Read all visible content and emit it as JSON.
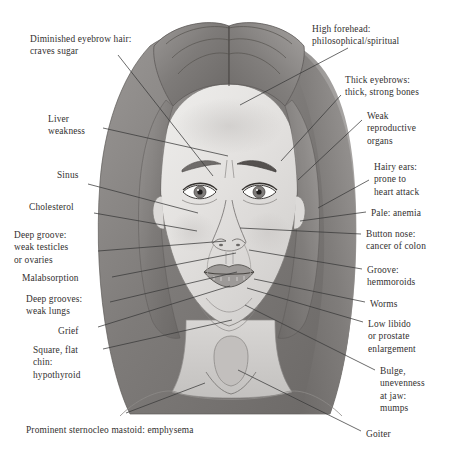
{
  "diagram": {
    "caption": "Prominent sternocleo mastoid: emphysema",
    "line_color": "#3a3a3a",
    "text_color": "#333030",
    "background": "#ffffff"
  },
  "labels_left": [
    {
      "id": "eyebrow-hair",
      "text": "Diminished eyebrow hair:\ncraves sugar",
      "x": 30,
      "y": 33
    },
    {
      "id": "liver",
      "text": "Liver\nweakness",
      "x": 48,
      "y": 113
    },
    {
      "id": "sinus",
      "text": "Sinus",
      "x": 57,
      "y": 169
    },
    {
      "id": "cholesterol",
      "text": "Cholesterol",
      "x": 29,
      "y": 201
    },
    {
      "id": "deep-groove",
      "text": "Deep groove:\nweak testicles\nor ovaries",
      "x": 14,
      "y": 229
    },
    {
      "id": "malabsorption",
      "text": "Malabsorption",
      "x": 22,
      "y": 272
    },
    {
      "id": "deep-grooves",
      "text": "Deep grooves:\nweak lungs",
      "x": 26,
      "y": 293
    },
    {
      "id": "grief",
      "text": "Grief",
      "x": 58,
      "y": 325
    },
    {
      "id": "square-chin",
      "text": "Square, flat\nchin:\nhypothyroid",
      "x": 33,
      "y": 344
    }
  ],
  "labels_right": [
    {
      "id": "high-forehead",
      "text": "High forehead:\nphilosophical/spiritual",
      "x": 312,
      "y": 23
    },
    {
      "id": "thick-eyebrows",
      "text": "Thick eyebrows:\nthick, strong bones",
      "x": 345,
      "y": 74
    },
    {
      "id": "weak-repro",
      "text": "Weak\nreproductive\norgans",
      "x": 367,
      "y": 110
    },
    {
      "id": "hairy-ears",
      "text": "Hairy ears:\nprone to\nheart attack",
      "x": 374,
      "y": 161
    },
    {
      "id": "pale-anemia",
      "text": "Pale: anemia",
      "x": 371,
      "y": 207
    },
    {
      "id": "button-nose",
      "text": "Button nose:\ncancer of colon",
      "x": 366,
      "y": 228
    },
    {
      "id": "groove-hem",
      "text": "Groove:\nhemmoroids",
      "x": 367,
      "y": 264
    },
    {
      "id": "worms",
      "text": "Worms",
      "x": 370,
      "y": 298
    },
    {
      "id": "low-libido",
      "text": "Low libido\nor prostate\nenlargement",
      "x": 368,
      "y": 318
    },
    {
      "id": "bulge-jaw",
      "text": "Bulge,\nunevenness\nat jaw:\nmumps",
      "x": 380,
      "y": 365
    },
    {
      "id": "goiter",
      "text": "Goiter",
      "x": 366,
      "y": 428
    }
  ],
  "caption": {
    "text": "Prominent sternocleo mastoid: emphysema",
    "x": 26,
    "y": 424
  },
  "leader_lines": [
    {
      "id": "lead-eyebrow-hair",
      "x1": 118,
      "y1": 55,
      "x2": 213,
      "y2": 176
    },
    {
      "id": "lead-liver",
      "x1": 103,
      "y1": 128,
      "x2": 228,
      "y2": 156
    },
    {
      "id": "lead-sinus",
      "x1": 88,
      "y1": 184,
      "x2": 198,
      "y2": 213
    },
    {
      "id": "lead-cholesterol",
      "x1": 94,
      "y1": 213,
      "x2": 197,
      "y2": 231
    },
    {
      "id": "lead-deep-groove",
      "x1": 98,
      "y1": 251,
      "x2": 226,
      "y2": 241
    },
    {
      "id": "lead-malabsorption",
      "x1": 112,
      "y1": 277,
      "x2": 236,
      "y2": 253
    },
    {
      "id": "lead-deep-grooves",
      "x1": 110,
      "y1": 302,
      "x2": 237,
      "y2": 272
    },
    {
      "id": "lead-grief",
      "x1": 98,
      "y1": 327,
      "x2": 230,
      "y2": 286
    },
    {
      "id": "lead-square-chin",
      "x1": 103,
      "y1": 349,
      "x2": 232,
      "y2": 320
    },
    {
      "id": "lead-sternocleo",
      "x1": 126,
      "y1": 413,
      "x2": 205,
      "y2": 383
    },
    {
      "id": "lead-high-forehead",
      "x1": 348,
      "y1": 48,
      "x2": 240,
      "y2": 105
    },
    {
      "id": "lead-thick-eyebrow",
      "x1": 341,
      "y1": 95,
      "x2": 281,
      "y2": 161
    },
    {
      "id": "lead-weak-repro",
      "x1": 362,
      "y1": 120,
      "x2": 298,
      "y2": 180
    },
    {
      "id": "lead-hairy-ears",
      "x1": 369,
      "y1": 180,
      "x2": 318,
      "y2": 208
    },
    {
      "id": "lead-pale",
      "x1": 366,
      "y1": 212,
      "x2": 300,
      "y2": 221
    },
    {
      "id": "lead-button-nose",
      "x1": 361,
      "y1": 234,
      "x2": 240,
      "y2": 228
    },
    {
      "id": "lead-groove-hem",
      "x1": 362,
      "y1": 269,
      "x2": 249,
      "y2": 250
    },
    {
      "id": "lead-worms",
      "x1": 365,
      "y1": 302,
      "x2": 254,
      "y2": 279
    },
    {
      "id": "lead-low-libido",
      "x1": 363,
      "y1": 322,
      "x2": 247,
      "y2": 288
    },
    {
      "id": "lead-bulge-jaw",
      "x1": 375,
      "y1": 370,
      "x2": 245,
      "y2": 305
    },
    {
      "id": "lead-goiter",
      "x1": 361,
      "y1": 431,
      "x2": 238,
      "y2": 370
    }
  ]
}
